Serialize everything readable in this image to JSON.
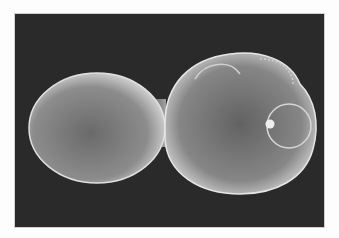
{
  "image": {
    "subject": "budding yeast cell (scanning electron micrograph)",
    "style": "grayscale",
    "colors": {
      "border": "#fdfdfd",
      "background": "#2a2a2a",
      "cell_highlight": "#e8e8e8",
      "cell_body": "#8a8a8a"
    }
  }
}
